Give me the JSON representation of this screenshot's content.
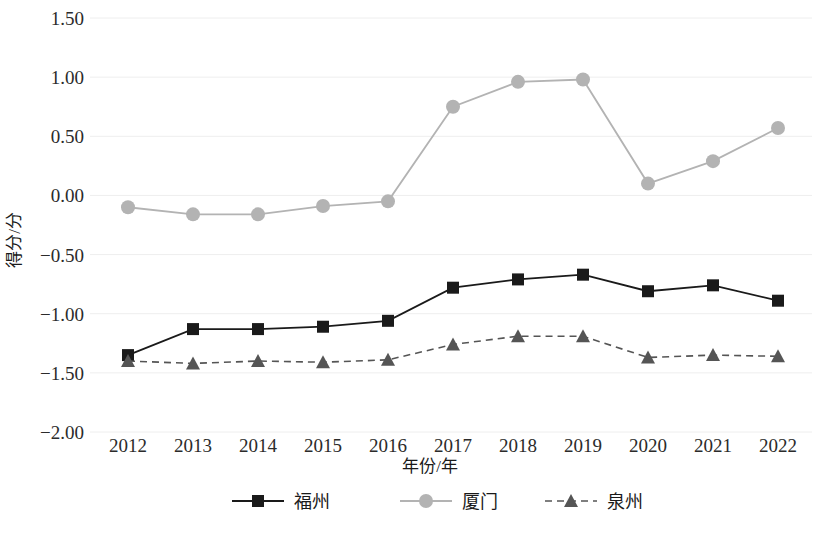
{
  "chart_data": {
    "type": "line",
    "title": "",
    "xlabel": "年份/年",
    "ylabel": "得分/分",
    "categories": [
      "2012",
      "2013",
      "2014",
      "2015",
      "2016",
      "2017",
      "2018",
      "2019",
      "2020",
      "2021",
      "2022"
    ],
    "x": [
      2012,
      2013,
      2014,
      2015,
      2016,
      2017,
      2018,
      2019,
      2020,
      2021,
      2022
    ],
    "ylim": [
      -2.0,
      1.5
    ],
    "ytick_labels": [
      "1.50",
      "1.00",
      "0.50",
      "0.00",
      "-0.50",
      "-1.00",
      "-1.50",
      "-2.00"
    ],
    "ytick_values": [
      1.5,
      1.0,
      0.5,
      0.0,
      -0.5,
      -1.0,
      -1.5,
      -2.0
    ],
    "grid": true,
    "legend_position": "bottom",
    "series": [
      {
        "name": "福州",
        "color": "#1a1a1a",
        "marker": "square",
        "dash": "solid",
        "values": [
          -1.35,
          -1.13,
          -1.13,
          -1.11,
          -1.06,
          -0.78,
          -0.71,
          -0.67,
          -0.81,
          -0.76,
          -0.89
        ]
      },
      {
        "name": "厦门",
        "color": "#b3b3b3",
        "marker": "circle",
        "dash": "solid",
        "values": [
          -0.1,
          -0.16,
          -0.16,
          -0.09,
          -0.05,
          0.75,
          0.96,
          0.98,
          0.1,
          0.29,
          0.57
        ]
      },
      {
        "name": "泉州",
        "color": "#555555",
        "marker": "triangle",
        "dash": "dashed",
        "values": [
          -1.4,
          -1.42,
          -1.4,
          -1.41,
          -1.39,
          -1.26,
          -1.19,
          -1.19,
          -1.37,
          -1.35,
          -1.36
        ]
      }
    ]
  },
  "legend": {
    "items": [
      {
        "label": "福州"
      },
      {
        "label": "厦门"
      },
      {
        "label": "泉州"
      }
    ]
  }
}
